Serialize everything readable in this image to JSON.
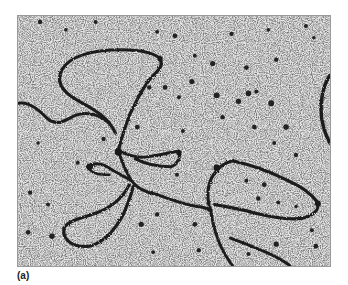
{
  "figure": {
    "panel_label": "(a)",
    "image_type": "electron-micrograph",
    "colors": {
      "background": "#d8d8d8",
      "filament": "#1e1e1e",
      "speckle_dark": "#2a2a2a",
      "speckle_light": "#f2f2f2",
      "border": "#9a9a9a"
    }
  }
}
